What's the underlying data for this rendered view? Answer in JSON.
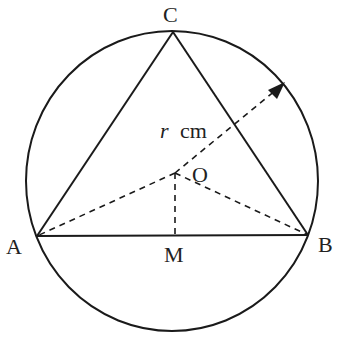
{
  "diagram": {
    "type": "geometry",
    "labels": {
      "A": "A",
      "B": "B",
      "C": "C",
      "O": "O",
      "M": "M",
      "radius_var": "r",
      "radius_unit": "cm"
    },
    "points": {
      "A": [
        37,
        236
      ],
      "B": [
        308,
        235
      ],
      "C": [
        173,
        32
      ],
      "O": [
        175,
        173
      ],
      "M": [
        175,
        236
      ],
      "arrow_tip": [
        284,
        83
      ]
    },
    "circle": {
      "cx": 172,
      "cy": 181,
      "rx": 146,
      "ry": 150
    },
    "colors": {
      "stroke": "#1a1a1a",
      "label": "#222222",
      "background": "#ffffff"
    }
  }
}
